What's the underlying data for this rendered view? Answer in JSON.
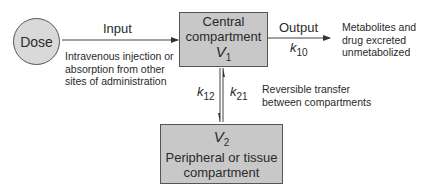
{
  "dose": {
    "label": "Dose"
  },
  "input": {
    "label": "Input",
    "description_lines": [
      "Intravenous injection or",
      "absorption from other",
      "sites of administration"
    ]
  },
  "central": {
    "line1": "Central",
    "line2": "compartment",
    "var": "V",
    "sub": "1"
  },
  "output": {
    "label": "Output",
    "rate": "k",
    "rate_sub": "10",
    "description_lines": [
      "Metabolites and",
      "drug excreted",
      "unmetabolized"
    ]
  },
  "transfer": {
    "k12": "k",
    "k12_sub": "12",
    "k21": "k",
    "k21_sub": "21",
    "description_lines": [
      "Reversible transfer",
      "between compartments"
    ]
  },
  "peripheral": {
    "var": "V",
    "sub": "2",
    "line1": "Peripheral or tissue",
    "line2": "compartment"
  },
  "colors": {
    "box_fill": "#c8c8c8",
    "circle_fill": "#d9d9d9",
    "stroke": "#555555"
  }
}
